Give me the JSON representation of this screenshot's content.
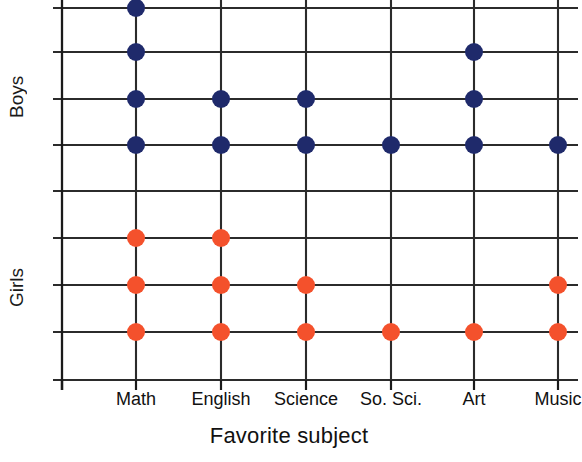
{
  "chart_data": {
    "type": "scatter",
    "title": "",
    "xlabel": "Favorite subject",
    "ylabel": "",
    "categories": [
      "Math",
      "English",
      "Science",
      "So. Sci.",
      "Art",
      "Music"
    ],
    "groups": [
      "Boys",
      "Girls"
    ],
    "series": [
      {
        "name": "Boys",
        "color": "#1f2a6b",
        "marker": "filled-circle",
        "values": [
          4,
          2,
          2,
          1,
          3,
          1
        ]
      },
      {
        "name": "Girls",
        "color": "#f4512c",
        "marker": "filled-circle",
        "values": [
          3,
          3,
          2,
          1,
          1,
          2
        ]
      }
    ],
    "grid": true,
    "legend": "none"
  },
  "axes": {
    "y_group_top_label": "Boys",
    "y_group_bottom_label": "Girls",
    "x_title": "Favorite subject",
    "x_tick_labels": [
      "Math",
      "English",
      "Science",
      "So. Sci.",
      "Art",
      "Music"
    ]
  },
  "style": {
    "boys_color": "#1f2a6b",
    "girls_color": "#f4512c",
    "grid_color": "#2b2b2b",
    "axis_color": "#1a1a1a",
    "background": "#ffffff"
  },
  "geometry": {
    "column_x": [
      136,
      221,
      306,
      391,
      474,
      558
    ],
    "row_y": [
      8,
      52,
      99,
      145,
      191,
      238,
      285,
      332,
      380
    ],
    "axis_x": 62,
    "dot_radius": 9
  }
}
